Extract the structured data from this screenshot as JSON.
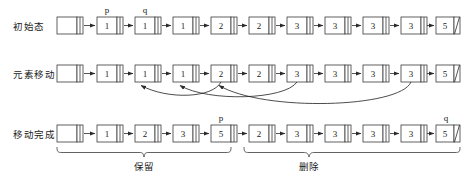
{
  "diagram": {
    "colors": {
      "stroke": "#3b3b3b",
      "arrow": "#2b2b2b",
      "text": "#1a1a1a",
      "background": "#ffffff"
    },
    "rows": [
      {
        "label": "初始态",
        "head_label": "",
        "nodes": [
          {
            "value": "1",
            "pointer": "p"
          },
          {
            "value": "1",
            "pointer": "q"
          },
          {
            "value": "1",
            "pointer": ""
          },
          {
            "value": "2",
            "pointer": ""
          },
          {
            "value": "2",
            "pointer": ""
          },
          {
            "value": "3",
            "pointer": ""
          },
          {
            "value": "3",
            "pointer": ""
          },
          {
            "value": "3",
            "pointer": ""
          },
          {
            "value": "3",
            "pointer": ""
          },
          {
            "value": "5",
            "pointer": ""
          },
          {
            "value": "5",
            "pointer": ""
          }
        ]
      },
      {
        "label": "元素移动",
        "head_label": "",
        "nodes": [
          {
            "value": "1",
            "pointer": ""
          },
          {
            "value": "1",
            "pointer": ""
          },
          {
            "value": "1",
            "pointer": ""
          },
          {
            "value": "2",
            "pointer": ""
          },
          {
            "value": "2",
            "pointer": ""
          },
          {
            "value": "3",
            "pointer": ""
          },
          {
            "value": "3",
            "pointer": ""
          },
          {
            "value": "3",
            "pointer": ""
          },
          {
            "value": "3",
            "pointer": ""
          },
          {
            "value": "5",
            "pointer": ""
          },
          {
            "value": "5",
            "pointer": ""
          }
        ],
        "move_arcs": [
          {
            "from_index": 3,
            "to_index": 1
          },
          {
            "from_index": 5,
            "to_index": 2
          },
          {
            "from_index": 9,
            "to_index": 3
          }
        ]
      },
      {
        "label": "移动完成",
        "head_label": "",
        "nodes": [
          {
            "value": "1",
            "pointer": ""
          },
          {
            "value": "2",
            "pointer": ""
          },
          {
            "value": "3",
            "pointer": ""
          },
          {
            "value": "5",
            "pointer": "p"
          },
          {
            "value": "2",
            "pointer": ""
          },
          {
            "value": "3",
            "pointer": ""
          },
          {
            "value": "3",
            "pointer": ""
          },
          {
            "value": "3",
            "pointer": ""
          },
          {
            "value": "3",
            "pointer": ""
          },
          {
            "value": "5",
            "pointer": ""
          },
          {
            "value": "5",
            "pointer": "q"
          }
        ],
        "braces": [
          {
            "label": "保留",
            "start_index": -1,
            "end_index": 3
          },
          {
            "label": "删除",
            "start_index": 4,
            "end_index": 10
          }
        ]
      }
    ]
  }
}
